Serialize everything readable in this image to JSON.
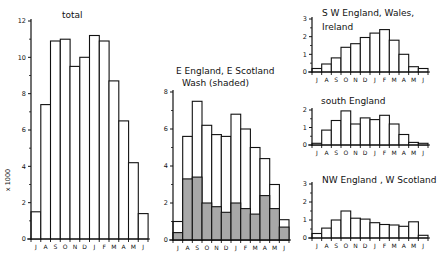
{
  "chart_data": [
    {
      "type": "bar",
      "title": "total",
      "ylabel": "x 1000",
      "xlabel": "",
      "categories": [
        "J",
        "A",
        "S",
        "O",
        "N",
        "D",
        "J",
        "F",
        "M",
        "A",
        "M",
        "J"
      ],
      "values": [
        1.5,
        7.4,
        10.9,
        11.0,
        9.5,
        10.0,
        11.2,
        10.9,
        8.7,
        6.5,
        4.2,
        1.4
      ],
      "ylim": [
        0,
        12
      ],
      "yticks": [
        0,
        2,
        4,
        6,
        8,
        10,
        12
      ],
      "grid": false,
      "frame": {
        "x0": 31,
        "x1": 148,
        "y0": 239,
        "y12": 21
      }
    },
    {
      "type": "bar",
      "title": "E England, E Scotland",
      "subtitle": "Wash (shaded)",
      "categories": [
        "J",
        "A",
        "S",
        "O",
        "N",
        "D",
        "J",
        "F",
        "M",
        "A",
        "M",
        "J"
      ],
      "series": [
        {
          "name": "E England, E Scotland (total)",
          "values": [
            1.0,
            5.6,
            7.5,
            6.2,
            5.7,
            5.6,
            6.8,
            6.0,
            5.0,
            4.4,
            3.0,
            1.1
          ]
        },
        {
          "name": "Wash (shaded)",
          "values": [
            0.4,
            3.3,
            3.4,
            2.0,
            1.8,
            1.5,
            2.0,
            1.7,
            1.4,
            2.4,
            1.7,
            0.7
          ]
        }
      ],
      "ylim": [
        0,
        8
      ],
      "yticks": [
        0,
        2,
        4,
        6,
        8
      ],
      "grid": false,
      "shade_color": "#a8a8a8"
    },
    {
      "type": "bar",
      "title": "S W England, Wales,",
      "subtitle": "Ireland",
      "categories": [
        "J",
        "A",
        "S",
        "O",
        "N",
        "D",
        "J",
        "F",
        "M",
        "A",
        "M",
        "J"
      ],
      "values": [
        0.2,
        0.45,
        0.8,
        1.4,
        1.6,
        1.95,
        2.2,
        2.4,
        1.8,
        1.0,
        0.3,
        0.2
      ],
      "ylim": [
        0,
        3
      ],
      "yticks": [
        0,
        1,
        2,
        3
      ],
      "grid": false
    },
    {
      "type": "bar",
      "title": "south England",
      "categories": [
        "J",
        "A",
        "S",
        "O",
        "N",
        "D",
        "J",
        "F",
        "M",
        "A",
        "M",
        "J"
      ],
      "values": [
        0.1,
        0.85,
        1.4,
        1.95,
        1.2,
        1.55,
        1.45,
        1.7,
        1.2,
        0.6,
        0.15,
        0.1
      ],
      "ylim": [
        0,
        2
      ],
      "yticks": [
        0,
        1,
        2
      ],
      "grid": false
    },
    {
      "type": "bar",
      "title": "NW England , W Scotland",
      "categories": [
        "J",
        "A",
        "S",
        "O",
        "N",
        "D",
        "J",
        "F",
        "M",
        "A",
        "M",
        "J"
      ],
      "values": [
        0.25,
        0.55,
        1.0,
        1.5,
        1.1,
        1.05,
        0.85,
        0.75,
        0.72,
        0.65,
        0.9,
        0.15
      ],
      "ylim": [
        0,
        3
      ],
      "yticks": [
        0,
        1,
        2,
        3
      ],
      "grid": false
    }
  ],
  "layout": {
    "panels": [
      {
        "x0": 31,
        "x1": 148,
        "ybase": 239,
        "ytop": 21,
        "title_x": 62,
        "title_y": 18,
        "title2_y": null
      },
      {
        "x0": 173,
        "x1": 289,
        "ybase": 240,
        "ytop": 92,
        "title_x": 176,
        "title_y": 74,
        "title2_y": 86
      },
      {
        "x0": 312,
        "x1": 428,
        "ybase": 72,
        "ytop": 19,
        "title_x": 322,
        "title_y": 16,
        "title2_y": 30
      },
      {
        "x0": 312,
        "x1": 428,
        "ybase": 145,
        "ytop": 110,
        "title_x": 321,
        "title_y": 104,
        "title2_y": null
      },
      {
        "x0": 312,
        "x1": 428,
        "ybase": 238,
        "ytop": 184,
        "title_x": 322,
        "title_y": 183,
        "title2_y": null
      }
    ]
  }
}
